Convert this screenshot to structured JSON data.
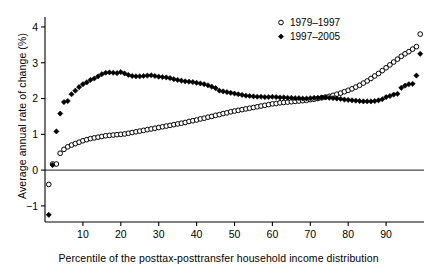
{
  "chart_data": {
    "type": "scatter",
    "title": "",
    "xlabel": "Percentile of the posttax-posttransfer household income distribution",
    "ylabel": "Average annual rate of change (%)",
    "xlim": [
      0,
      100
    ],
    "ylim": [
      -1.45,
      4.25
    ],
    "xticks": [
      10,
      20,
      30,
      40,
      50,
      60,
      70,
      80,
      90
    ],
    "yticks": [
      -1,
      0,
      1,
      2,
      3,
      4
    ],
    "xtick_labels": [
      "10",
      "20",
      "30",
      "40",
      "50",
      "60",
      "70",
      "80",
      "90"
    ],
    "ytick_labels": [
      "−1",
      "0",
      "1",
      "2",
      "3",
      "4"
    ],
    "grid": false,
    "zero_line": 0,
    "legend_position": "top-right",
    "legend": [
      {
        "name": "1979–1997",
        "marker": "open-circle",
        "color": "#000000"
      },
      {
        "name": "1997–2005",
        "marker": "filled-diamond",
        "color": "#000000"
      }
    ],
    "series": [
      {
        "name": "1979–1997",
        "marker": "open-circle",
        "color": "#000000",
        "x": [
          1,
          2,
          3,
          4,
          5,
          6,
          7,
          8,
          9,
          10,
          11,
          12,
          13,
          14,
          15,
          16,
          17,
          18,
          19,
          20,
          21,
          22,
          23,
          24,
          25,
          26,
          27,
          28,
          29,
          30,
          31,
          32,
          33,
          34,
          35,
          36,
          37,
          38,
          39,
          40,
          41,
          42,
          43,
          44,
          45,
          46,
          47,
          48,
          49,
          50,
          51,
          52,
          53,
          54,
          55,
          56,
          57,
          58,
          59,
          60,
          61,
          62,
          63,
          64,
          65,
          66,
          67,
          68,
          69,
          70,
          71,
          72,
          73,
          74,
          75,
          76,
          77,
          78,
          79,
          80,
          81,
          82,
          83,
          84,
          85,
          86,
          87,
          88,
          89,
          90,
          91,
          92,
          93,
          94,
          95,
          96,
          97,
          98,
          99
        ],
        "y": [
          -0.4,
          0.17,
          0.17,
          0.47,
          0.58,
          0.65,
          0.7,
          0.74,
          0.78,
          0.82,
          0.85,
          0.88,
          0.9,
          0.92,
          0.94,
          0.96,
          0.97,
          0.98,
          0.99,
          1.0,
          1.01,
          1.03,
          1.05,
          1.07,
          1.09,
          1.11,
          1.13,
          1.15,
          1.17,
          1.19,
          1.21,
          1.23,
          1.25,
          1.27,
          1.29,
          1.31,
          1.33,
          1.36,
          1.38,
          1.4,
          1.43,
          1.45,
          1.48,
          1.5,
          1.53,
          1.55,
          1.58,
          1.6,
          1.63,
          1.65,
          1.67,
          1.69,
          1.71,
          1.73,
          1.75,
          1.77,
          1.79,
          1.81,
          1.83,
          1.85,
          1.86,
          1.88,
          1.89,
          1.9,
          1.91,
          1.92,
          1.93,
          1.94,
          1.95,
          1.97,
          1.98,
          2.0,
          2.02,
          2.04,
          2.06,
          2.09,
          2.12,
          2.15,
          2.19,
          2.23,
          2.27,
          2.32,
          2.37,
          2.43,
          2.49,
          2.56,
          2.63,
          2.7,
          2.78,
          2.86,
          2.94,
          3.02,
          3.1,
          3.18,
          3.25,
          3.31,
          3.38,
          3.45,
          3.8
        ]
      },
      {
        "name": "1997–2005",
        "marker": "filled-diamond",
        "color": "#000000",
        "x": [
          1,
          2,
          3,
          4,
          5,
          6,
          7,
          8,
          9,
          10,
          11,
          12,
          13,
          14,
          15,
          16,
          17,
          18,
          19,
          20,
          21,
          22,
          23,
          24,
          25,
          26,
          27,
          28,
          29,
          30,
          31,
          32,
          33,
          34,
          35,
          36,
          37,
          38,
          39,
          40,
          41,
          42,
          43,
          44,
          45,
          46,
          47,
          48,
          49,
          50,
          51,
          52,
          53,
          54,
          55,
          56,
          57,
          58,
          59,
          60,
          61,
          62,
          63,
          64,
          65,
          66,
          67,
          68,
          69,
          70,
          71,
          72,
          73,
          74,
          75,
          76,
          77,
          78,
          79,
          80,
          81,
          82,
          83,
          84,
          85,
          86,
          87,
          88,
          89,
          90,
          91,
          92,
          93,
          94,
          95,
          96,
          97,
          98,
          99
        ],
        "y": [
          -1.25,
          0.14,
          1.08,
          1.58,
          1.9,
          1.93,
          2.12,
          2.22,
          2.32,
          2.4,
          2.45,
          2.52,
          2.56,
          2.62,
          2.68,
          2.72,
          2.73,
          2.72,
          2.71,
          2.74,
          2.7,
          2.66,
          2.63,
          2.62,
          2.62,
          2.63,
          2.64,
          2.65,
          2.63,
          2.61,
          2.6,
          2.59,
          2.57,
          2.54,
          2.52,
          2.5,
          2.48,
          2.47,
          2.46,
          2.44,
          2.42,
          2.4,
          2.37,
          2.33,
          2.29,
          2.22,
          2.2,
          2.18,
          2.16,
          2.14,
          2.12,
          2.1,
          2.08,
          2.07,
          2.06,
          2.05,
          2.05,
          2.04,
          2.04,
          2.05,
          2.04,
          2.03,
          2.03,
          2.02,
          2.02,
          2.01,
          2.01,
          2.0,
          2.0,
          2.01,
          2.02,
          2.02,
          2.03,
          2.03,
          2.02,
          2.01,
          2.0,
          1.99,
          1.97,
          1.96,
          1.95,
          1.94,
          1.93,
          1.92,
          1.92,
          1.92,
          1.93,
          1.95,
          1.98,
          2.04,
          2.07,
          2.11,
          2.13,
          2.3,
          2.36,
          2.4,
          2.41,
          2.64,
          3.25
        ]
      }
    ]
  },
  "legend": {
    "entry_1979_label": "1979–1997",
    "entry_1997_label": "1997–2005"
  },
  "axes": {
    "ylabel": "Average annual rate of change (%)",
    "xlabel": "Percentile of the posttax-posttransfer household income distribution"
  },
  "colors": {
    "marker": "#000000",
    "axis": "#000000",
    "background": "#ffffff"
  }
}
